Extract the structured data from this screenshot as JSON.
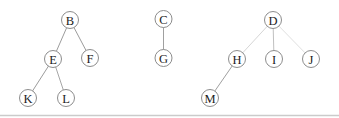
{
  "diagram": {
    "background_color": "#ffffff",
    "node_style": {
      "radius": 8.5,
      "fill": "#ffffff",
      "stroke": "#8d8d8d",
      "stroke_width": 1,
      "text_color": "#1c1c1c"
    },
    "trees_structure": {
      "B": [
        "E",
        "F"
      ],
      "E": [
        "K",
        "L"
      ],
      "C": [
        "G"
      ],
      "D": [
        "H",
        "I",
        "J"
      ],
      "H": [
        "M"
      ]
    },
    "nodes": [
      {
        "id": "B",
        "label": "B",
        "x": 70,
        "y": 20
      },
      {
        "id": "E",
        "label": "E",
        "x": 53,
        "y": 59
      },
      {
        "id": "F",
        "label": "F",
        "x": 90,
        "y": 58
      },
      {
        "id": "K",
        "label": "K",
        "x": 28,
        "y": 98
      },
      {
        "id": "L",
        "label": "L",
        "x": 66,
        "y": 98
      },
      {
        "id": "C",
        "label": "C",
        "x": 163.5,
        "y": 19
      },
      {
        "id": "G",
        "label": "G",
        "x": 163.5,
        "y": 58
      },
      {
        "id": "D",
        "label": "D",
        "x": 273,
        "y": 20
      },
      {
        "id": "H",
        "label": "H",
        "x": 237,
        "y": 59
      },
      {
        "id": "I",
        "label": "I",
        "x": 274,
        "y": 59
      },
      {
        "id": "J",
        "label": "J",
        "x": 311,
        "y": 59
      },
      {
        "id": "M",
        "label": "M",
        "x": 210,
        "y": 98
      }
    ],
    "edges": [
      {
        "from": "B",
        "to": "E",
        "color": "#9c9c9c"
      },
      {
        "from": "B",
        "to": "F",
        "color": "#9c9c9c"
      },
      {
        "from": "E",
        "to": "K",
        "color": "#9c9c9c"
      },
      {
        "from": "E",
        "to": "L",
        "color": "#a6a6a6"
      },
      {
        "from": "C",
        "to": "G",
        "color": "#a0a0a0"
      },
      {
        "from": "D",
        "to": "H",
        "color": "#d6d6d6"
      },
      {
        "from": "D",
        "to": "I",
        "color": "#c0c0c0"
      },
      {
        "from": "D",
        "to": "J",
        "color": "#e0e0e0"
      },
      {
        "from": "H",
        "to": "M",
        "color": "#a0a0a0"
      }
    ],
    "bottom_rule": {
      "y": 115.5,
      "x1": 0,
      "x2": 339,
      "color": "#cbcbcb",
      "width": 1.4
    }
  }
}
